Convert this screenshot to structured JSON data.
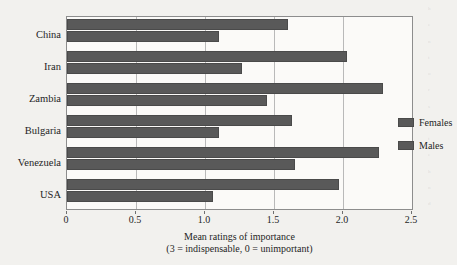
{
  "chart_data": {
    "type": "bar",
    "orientation": "horizontal",
    "title": "",
    "xlabel": "Mean ratings of importance\n(3 = indispensable, 0 = unimportant)",
    "xlabel_line1": "Mean ratings of importance",
    "xlabel_line2": "(3 = indispensable, 0 = unimportant)",
    "ylabel": "",
    "categories": [
      "China",
      "Iran",
      "Zambia",
      "Bulgaria",
      "Venezuela",
      "USA"
    ],
    "series": [
      {
        "name": "Females",
        "values": [
          1.6,
          2.03,
          2.29,
          1.63,
          2.26,
          1.97
        ],
        "color": "#595959"
      },
      {
        "name": "Males",
        "values": [
          1.1,
          1.27,
          1.45,
          1.1,
          1.65,
          1.06
        ],
        "color": "#595959"
      }
    ],
    "xlim": [
      0,
      2.5
    ],
    "xticks": [
      "0",
      "0.5",
      "1.0",
      "1.5",
      "2.0",
      "2.5"
    ],
    "xtick_values": [
      0,
      0.5,
      1.0,
      1.5,
      2.0,
      2.5
    ],
    "grid": "vertical",
    "legend_position": "inside-right",
    "legend_entries": [
      "Females",
      "Males"
    ]
  },
  "page_bleed": {
    "lines": [
      "h",
      "e",
      "n",
      "t",
      "o",
      "r",
      "s",
      "i",
      "t",
      "e",
      "h",
      "n",
      "d"
    ]
  }
}
